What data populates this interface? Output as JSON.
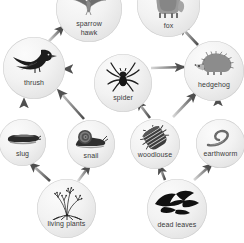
{
  "diagram": {
    "type": "food-web",
    "background_color": "#ffffff",
    "node_fill_color": "#ededed",
    "node_edge_color": "#cfcfcf",
    "label_color": "#3a3a3a",
    "arrow_color": "#5b5b5b"
  },
  "nodes": [
    {
      "id": "sparrow-hawk",
      "label": "sparrow\nhawk",
      "icon": "sparrow-hawk-icon",
      "trophic_level": "tertiary consumer",
      "x": 56,
      "y": -24,
      "size": 66,
      "label_top": 44
    },
    {
      "id": "fox",
      "label": "fox",
      "icon": "fox-icon",
      "trophic_level": "tertiary consumer",
      "x": 137,
      "y": -26,
      "size": 63,
      "label_top": 48
    },
    {
      "id": "thrush",
      "label": "thrush",
      "icon": "thrush-icon",
      "trophic_level": "secondary consumer",
      "x": 3,
      "y": 37,
      "size": 62,
      "label_top": 42
    },
    {
      "id": "spider",
      "label": "spider",
      "icon": "spider-icon",
      "trophic_level": "secondary consumer",
      "x": 94,
      "y": 54,
      "size": 58,
      "label_top": 40
    },
    {
      "id": "hedgehog",
      "label": "hedgehog",
      "icon": "hedgehog-icon",
      "trophic_level": "secondary consumer",
      "x": 184,
      "y": 41,
      "size": 60,
      "label_top": 40
    },
    {
      "id": "slug",
      "label": "slug",
      "icon": "slug-icon",
      "trophic_level": "primary consumer",
      "x": -1,
      "y": 119,
      "size": 47,
      "label_top": 31
    },
    {
      "id": "snail",
      "label": "snail",
      "icon": "snail-icon",
      "trophic_level": "primary consumer",
      "x": 67,
      "y": 120,
      "size": 48,
      "label_top": 32
    },
    {
      "id": "woodlouse",
      "label": "woodlouse",
      "icon": "woodlouse-icon",
      "trophic_level": "decomposer",
      "x": 130,
      "y": 119,
      "size": 50,
      "label_top": 32
    },
    {
      "id": "earthworm",
      "label": "earthworm",
      "icon": "earthworm-icon",
      "trophic_level": "decomposer",
      "x": 196,
      "y": 119,
      "size": 49,
      "label_top": 31
    },
    {
      "id": "living-plants",
      "label": "living plants",
      "icon": "living-plants-icon",
      "trophic_level": "producer",
      "x": 37,
      "y": 179,
      "size": 59,
      "label_top": 41
    },
    {
      "id": "dead-leaves",
      "label": "dead leaves",
      "icon": "dead-leaves-icon",
      "trophic_level": "detritus",
      "x": 147,
      "y": 179,
      "size": 60,
      "label_top": 42
    }
  ],
  "arrows": [
    {
      "id": "living-plants-to-slug",
      "from": "living plants",
      "to": "slug",
      "x1": 50,
      "y1": 181,
      "x2": 30,
      "y2": 163
    },
    {
      "id": "living-plants-to-snail",
      "from": "living plants",
      "to": "snail",
      "x1": 78,
      "y1": 181,
      "x2": 90,
      "y2": 165
    },
    {
      "id": "dead-leaves-to-woodlouse",
      "from": "dead leaves",
      "to": "woodlouse",
      "x1": 165,
      "y1": 180,
      "x2": 159,
      "y2": 165
    },
    {
      "id": "dead-leaves-to-earthworm",
      "from": "dead leaves",
      "to": "earthworm",
      "x1": 194,
      "y1": 180,
      "x2": 212,
      "y2": 164
    },
    {
      "id": "slug-to-thrush",
      "from": "slug",
      "to": "thrush",
      "x1": 24,
      "y1": 117,
      "x2": 24,
      "y2": 99
    },
    {
      "id": "snail-to-thrush",
      "from": "snail",
      "to": "thrush",
      "x1": 84,
      "y1": 119,
      "x2": 58,
      "y2": 90
    },
    {
      "id": "woodlouse-to-spider",
      "from": "woodlouse",
      "to": "spider",
      "x1": 150,
      "y1": 118,
      "x2": 137,
      "y2": 101
    },
    {
      "id": "woodlouse-to-hedgehog",
      "from": "woodlouse",
      "to": "hedgehog",
      "x1": 173,
      "y1": 117,
      "x2": 196,
      "y2": 93
    },
    {
      "id": "earthworm-to-hedgehog",
      "from": "earthworm",
      "to": "hedgehog",
      "x1": 218,
      "y1": 117,
      "x2": 218,
      "y2": 97
    },
    {
      "id": "spider-to-thrush",
      "from": "spider",
      "to": "thrush",
      "x1": 96,
      "y1": 69,
      "x2": 64,
      "y2": 69
    },
    {
      "id": "spider-to-hedgehog",
      "from": "spider",
      "to": "hedgehog",
      "x1": 151,
      "y1": 68,
      "x2": 184,
      "y2": 67
    },
    {
      "id": "thrush-to-sparrow-hawk",
      "from": "thrush",
      "to": "sparrow hawk",
      "x1": 48,
      "y1": 42,
      "x2": 64,
      "y2": 26
    },
    {
      "id": "hedgehog-to-fox",
      "from": "hedgehog",
      "to": "fox",
      "x1": 198,
      "y1": 45,
      "x2": 180,
      "y2": 26
    }
  ]
}
